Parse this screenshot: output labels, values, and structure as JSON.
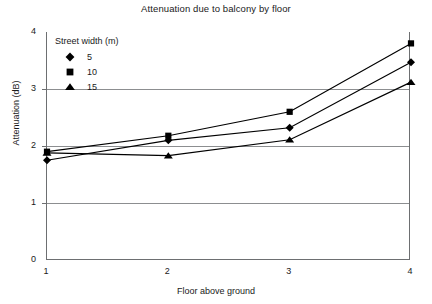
{
  "chart_data": {
    "type": "line",
    "title": "Attenuation due to balcony by floor",
    "xlabel": "Floor above ground",
    "ylabel": "Attenuation (dB)",
    "x": [
      1,
      2,
      3,
      4
    ],
    "xticklabels": [
      "1",
      "2",
      "3",
      "4"
    ],
    "yticklabels": [
      "0",
      "1",
      "2",
      "3",
      "4"
    ],
    "xlim": [
      1,
      4
    ],
    "ylim": [
      0,
      4
    ],
    "grid": "horizontal-gridlines-at-1-2-3",
    "legend_position": "top-left-inside-plot",
    "legend_title": "Street width (m)",
    "series": [
      {
        "name": "5",
        "marker": "diamond",
        "color": "#000000",
        "values": [
          1.75,
          2.1,
          2.32,
          3.47
        ]
      },
      {
        "name": "10",
        "marker": "square",
        "color": "#000000",
        "values": [
          1.9,
          2.18,
          2.6,
          3.8
        ]
      },
      {
        "name": "15",
        "marker": "triangle",
        "color": "#000000",
        "values": [
          1.88,
          1.83,
          2.11,
          3.12
        ]
      }
    ]
  },
  "axes": {
    "y_ticks": [
      {
        "label": "4",
        "value": 4
      },
      {
        "label": "3",
        "value": 3
      },
      {
        "label": "2",
        "value": 2
      },
      {
        "label": "1",
        "value": 1
      },
      {
        "label": "0",
        "value": 0
      }
    ],
    "x_ticks": [
      {
        "label": "1",
        "value": 1
      },
      {
        "label": "2",
        "value": 2
      },
      {
        "label": "3",
        "value": 3
      },
      {
        "label": "4",
        "value": 4
      }
    ]
  },
  "legend": {
    "title": "Street width (m)",
    "items": [
      {
        "label": "5",
        "marker": "diamond-marker-icon"
      },
      {
        "label": "10",
        "marker": "square-marker-icon"
      },
      {
        "label": "15",
        "marker": "triangle-marker-icon"
      }
    ]
  },
  "colors": {
    "series_ink": "#000000",
    "axis": "#6d6f71",
    "gridline": "#8c8e90",
    "background": "#ffffff"
  }
}
